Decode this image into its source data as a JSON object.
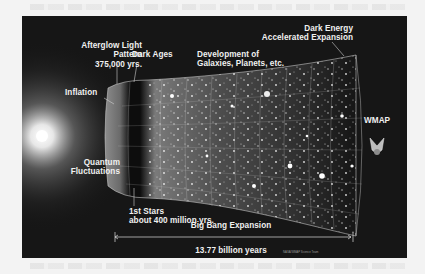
{
  "diagram": {
    "labels": {
      "afterglow": [
        "Afterglow Light",
        "Pattern",
        "375,000 yrs."
      ],
      "dark_ages": "Dark Ages",
      "development": [
        "Development of",
        "Galaxies, Planets, etc."
      ],
      "dark_energy": [
        "Dark Energy",
        "Accelerated Expansion"
      ],
      "inflation": "Inflation",
      "quantum": [
        "Quantum",
        "Fluctuations"
      ],
      "wmap": "WMAP",
      "first_stars": [
        "1st Stars",
        "about 400 million yrs."
      ],
      "expansion": "Big Bang Expansion",
      "age": "13.77 billion years",
      "credit": "NASA/WMAP Science Team"
    },
    "icons": {
      "big_bang": "bright-flash",
      "universe": "expanding-funnel-grid",
      "satellite": "wmap-probe"
    },
    "colors": {
      "background": "#161616",
      "text": "#f0f0f0",
      "page": "#f3f3f3"
    }
  }
}
